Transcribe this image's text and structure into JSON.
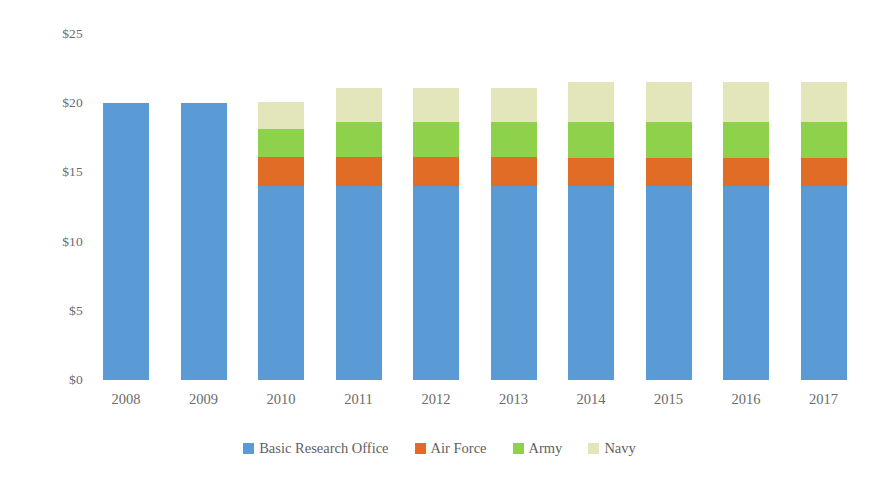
{
  "chart_data": {
    "type": "bar",
    "subtype": "stacked-column",
    "title": "",
    "xlabel": "",
    "ylabel": "",
    "categories": [
      "2008",
      "2009",
      "2010",
      "2011",
      "2012",
      "2013",
      "2014",
      "2015",
      "2016",
      "2017"
    ],
    "series": [
      {
        "name": "Basic Research Office",
        "color": "#5b9bd5",
        "values": [
          20.0,
          20.0,
          14.0,
          14.0,
          14.0,
          14.0,
          14.0,
          14.0,
          14.0,
          14.0
        ]
      },
      {
        "name": "Air Force",
        "color": "#e06c26",
        "values": [
          0,
          0,
          2.1,
          2.1,
          2.1,
          2.1,
          2.0,
          2.0,
          2.0,
          2.0
        ]
      },
      {
        "name": "Army",
        "color": "#8ed24c",
        "values": [
          0,
          0,
          2.0,
          2.5,
          2.5,
          2.5,
          2.6,
          2.6,
          2.6,
          2.6
        ]
      },
      {
        "name": "Navy",
        "color": "#e3e5bb",
        "values": [
          0,
          0,
          2.0,
          2.5,
          2.5,
          2.5,
          2.9,
          2.9,
          2.9,
          2.9
        ]
      }
    ],
    "totals": [
      20.0,
      20.0,
      20.1,
      21.1,
      21.1,
      21.1,
      21.5,
      21.5,
      21.5,
      21.5
    ],
    "y_ticks": [
      {
        "label": "$25",
        "value": 25
      },
      {
        "label": "$20",
        "value": 20
      },
      {
        "label": "$15",
        "value": 15
      },
      {
        "label": "$10",
        "value": 10
      },
      {
        "label": "$5",
        "value": 5
      },
      {
        "label": "$0",
        "value": 0
      }
    ],
    "ylim": [
      0,
      25
    ],
    "grid": false,
    "legend_position": "bottom",
    "axis_tick_format": "$#"
  },
  "legend": {
    "items": [
      {
        "label": "Basic Research Office",
        "color": "#5b9bd5"
      },
      {
        "label": "Air Force",
        "color": "#e06c26"
      },
      {
        "label": "Army",
        "color": "#8ed24c"
      },
      {
        "label": "Navy",
        "color": "#e3e5bb"
      }
    ]
  }
}
